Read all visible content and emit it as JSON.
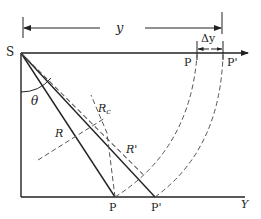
{
  "diagram": {
    "type": "geometry",
    "labels": {
      "source": "S",
      "dimension_y": "y",
      "dimension_dy": "Δy",
      "top_p": "P",
      "top_p_prime": "P'",
      "bottom_p": "P",
      "bottom_p_prime": "P'",
      "angle": "θ",
      "radius_r": "R",
      "radius_rc": "R",
      "radius_rc_sub": "c",
      "radius_r_prime": "R'",
      "axis_y": "Y"
    },
    "colors": {
      "line": "#222222",
      "dashed": "#555555",
      "background": "#ffffff"
    }
  }
}
